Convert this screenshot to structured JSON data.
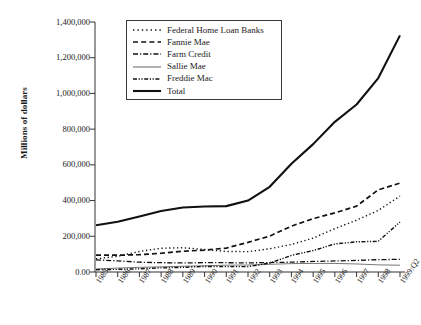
{
  "axes": {
    "ylabel": "Millions of dollars",
    "yticks": [
      "0.00",
      "200,000",
      "400,000",
      "600,000",
      "800,000",
      "1,000,000",
      "1,200,000",
      "1,400,000"
    ],
    "ytick_values": [
      0,
      200000,
      400000,
      600000,
      800000,
      1000000,
      1200000,
      1400000
    ],
    "ylim": [
      0,
      1400000
    ],
    "xticks": [
      "1985",
      "1986",
      "1987",
      "1988",
      "1989",
      "1990",
      "1991",
      "1992",
      "1993",
      "1994",
      "1995",
      "1996",
      "1997",
      "1998",
      "1999:Q2"
    ]
  },
  "legend": {
    "position": "top-center",
    "items": [
      {
        "label": "Federal Home Loan Banks",
        "style": "dotted",
        "icon": "dotted-line-icon"
      },
      {
        "label": "Fannie Mae",
        "style": "dashed",
        "icon": "dashed-line-icon"
      },
      {
        "label": "Farm Credit",
        "style": "dash-dot",
        "icon": "dash-dot-line-icon"
      },
      {
        "label": "Sallie Mae",
        "style": "thin-solid",
        "icon": "thin-solid-line-icon"
      },
      {
        "label": "Freddie Mac",
        "style": "dash-dot-dot",
        "icon": "dash-dot-dot-line-icon"
      },
      {
        "label": "Total",
        "style": "thick-solid",
        "icon": "thick-solid-line-icon"
      }
    ]
  },
  "chart_data": {
    "type": "line",
    "title": "",
    "xlabel": "",
    "ylabel": "Millions of dollars",
    "ylim": [
      0,
      1400000
    ],
    "grid": false,
    "legend_position": "top-center",
    "categories": [
      "1985",
      "1986",
      "1987",
      "1988",
      "1989",
      "1990",
      "1991",
      "1992",
      "1993",
      "1994",
      "1995",
      "1996",
      "1997",
      "1998",
      "1999:Q2"
    ],
    "series": [
      {
        "name": "Federal Home Loan Banks",
        "style": "dotted",
        "values": [
          74000,
          88000,
          115000,
          133000,
          136000,
          126000,
          115000,
          114000,
          130000,
          154000,
          190000,
          243000,
          290000,
          345000,
          425000
        ]
      },
      {
        "name": "Fannie Mae",
        "style": "dashed",
        "values": [
          94000,
          94000,
          97000,
          105000,
          116000,
          123000,
          134000,
          166000,
          201000,
          257000,
          299000,
          331000,
          369000,
          460000,
          498000
        ]
      },
      {
        "name": "Farm Credit",
        "style": "dash-dot",
        "values": [
          68000,
          62000,
          55000,
          52000,
          51000,
          52000,
          52000,
          51000,
          53000,
          55000,
          59000,
          62000,
          65000,
          69000,
          71000
        ]
      },
      {
        "name": "Sallie Mae",
        "style": "thin-solid",
        "values": [
          17000,
          22000,
          26000,
          29000,
          32000,
          35000,
          38000,
          39000,
          43000,
          47000,
          48000,
          48000,
          45000,
          40000,
          38000
        ]
      },
      {
        "name": "Freddie Mac",
        "style": "dash-dot-dot",
        "values": [
          13000,
          15000,
          18000,
          23000,
          26000,
          31000,
          30000,
          30000,
          50000,
          93000,
          120000,
          157000,
          169000,
          172000,
          280000
        ]
      },
      {
        "name": "Total",
        "style": "thick-solid",
        "values": [
          262000,
          281000,
          311000,
          342000,
          361000,
          367000,
          369000,
          400000,
          477000,
          606000,
          716000,
          841000,
          938000,
          1086000,
          1325000
        ]
      }
    ]
  }
}
